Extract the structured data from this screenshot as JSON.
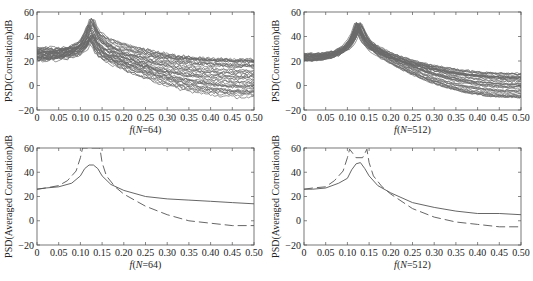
{
  "chart_data": [
    {
      "id": "top-left",
      "type": "line",
      "ylabel": "PSD(Correlation)dB",
      "xlabel_prefix": "f",
      "xlabel_suffix": "(N=64)",
      "xlim": [
        0,
        0.5
      ],
      "ylim": [
        -20,
        60
      ],
      "xticks": [
        "0",
        "0.05",
        "0.10",
        "0.15",
        "0.20",
        "0.25",
        "0.30",
        "0.35",
        "0.40",
        "0.45",
        "0.50"
      ],
      "yticks": [
        "−20",
        "0",
        "20",
        "40",
        "60"
      ],
      "ytick_values": [
        -20,
        0,
        20,
        40,
        60
      ],
      "grid": false,
      "ensemble": {
        "count": 40,
        "style": "solid",
        "peak_f": 0.125,
        "peak_db_range": [
          35,
          55
        ],
        "start_db_range": [
          20,
          31
        ],
        "end_db_range": [
          -10,
          22
        ]
      }
    },
    {
      "id": "top-right",
      "type": "line",
      "ylabel": "PSD(Correlation)dB",
      "xlabel_prefix": "f",
      "xlabel_suffix": "(N=512)",
      "xlim": [
        0,
        0.5
      ],
      "ylim": [
        -20,
        60
      ],
      "xticks": [
        "0",
        "0.05",
        "0.10",
        "0.15",
        "0.20",
        "0.25",
        "0.30",
        "0.35",
        "0.40",
        "0.45",
        "0.50"
      ],
      "yticks": [
        "−20",
        "0",
        "20",
        "40",
        "60"
      ],
      "ytick_values": [
        -20,
        0,
        20,
        40,
        60
      ],
      "grid": false,
      "ensemble": {
        "count": 40,
        "style": "solid",
        "peak_f": 0.125,
        "peak_db_range": [
          44,
          52
        ],
        "start_db_range": [
          20,
          26
        ],
        "end_db_range": [
          -10,
          10
        ]
      }
    },
    {
      "id": "bottom-left",
      "type": "line",
      "ylabel": "PSD(Averaged Correlation)dB",
      "xlabel_prefix": "f",
      "xlabel_suffix": "(N=64)",
      "xlim": [
        0,
        0.5
      ],
      "ylim": [
        -20,
        60
      ],
      "xticks": [
        "0",
        "0.05",
        "0.10",
        "0.15",
        "0.20",
        "0.25",
        "0.30",
        "0.35",
        "0.40",
        "0.45",
        "0.50"
      ],
      "yticks": [
        "−20",
        "0",
        "20",
        "40",
        "60"
      ],
      "ytick_values": [
        -20,
        0,
        20,
        40,
        60
      ],
      "grid": false,
      "series": [
        {
          "name": "averaged",
          "style": "solid",
          "x": [
            0,
            0.02,
            0.05,
            0.08,
            0.1,
            0.11,
            0.12,
            0.13,
            0.14,
            0.15,
            0.17,
            0.2,
            0.25,
            0.3,
            0.35,
            0.4,
            0.45,
            0.5
          ],
          "y": [
            26,
            27,
            28,
            31,
            37,
            43,
            46,
            46,
            43,
            37,
            30,
            25,
            20,
            18,
            17,
            16,
            15,
            14
          ]
        },
        {
          "name": "true",
          "style": "dashed",
          "x": [
            0,
            0.02,
            0.05,
            0.07,
            0.09,
            0.1,
            0.105,
            0.145,
            0.15,
            0.16,
            0.18,
            0.2,
            0.25,
            0.3,
            0.35,
            0.4,
            0.45,
            0.5
          ],
          "y": [
            26,
            27,
            29,
            33,
            41,
            52,
            60,
            60,
            48,
            37,
            28,
            22,
            12,
            5,
            0,
            -2,
            -4,
            -4
          ]
        }
      ]
    },
    {
      "id": "bottom-right",
      "type": "line",
      "ylabel": "PSD(Averaged Correlation)dB",
      "xlabel_prefix": "f",
      "xlabel_suffix": "(N=512)",
      "xlim": [
        0,
        0.5
      ],
      "ylim": [
        -20,
        60
      ],
      "xticks": [
        "0",
        "0.05",
        "0.10",
        "0.15",
        "0.20",
        "0.25",
        "0.30",
        "0.35",
        "0.40",
        "0.45",
        "0.50"
      ],
      "yticks": [
        "−20",
        "0",
        "20",
        "40",
        "60"
      ],
      "ytick_values": [
        -20,
        0,
        20,
        40,
        60
      ],
      "grid": false,
      "series": [
        {
          "name": "averaged",
          "style": "solid",
          "x": [
            0,
            0.02,
            0.05,
            0.08,
            0.1,
            0.11,
            0.12,
            0.13,
            0.14,
            0.15,
            0.17,
            0.2,
            0.25,
            0.3,
            0.35,
            0.4,
            0.45,
            0.5
          ],
          "y": [
            26,
            26,
            27,
            31,
            35,
            42,
            47,
            48,
            43,
            37,
            29,
            23,
            15,
            11,
            8,
            6,
            6,
            5
          ]
        },
        {
          "name": "true",
          "style": "dashed",
          "x": [
            0,
            0.02,
            0.05,
            0.07,
            0.09,
            0.1,
            0.105,
            0.12,
            0.135,
            0.145,
            0.15,
            0.16,
            0.18,
            0.2,
            0.25,
            0.3,
            0.35,
            0.4,
            0.45,
            0.5
          ],
          "y": [
            26,
            27,
            28,
            33,
            41,
            52,
            59,
            52,
            52,
            59,
            48,
            37,
            28,
            22,
            10,
            3,
            -1,
            -3,
            -5,
            -5
          ]
        }
      ]
    }
  ]
}
